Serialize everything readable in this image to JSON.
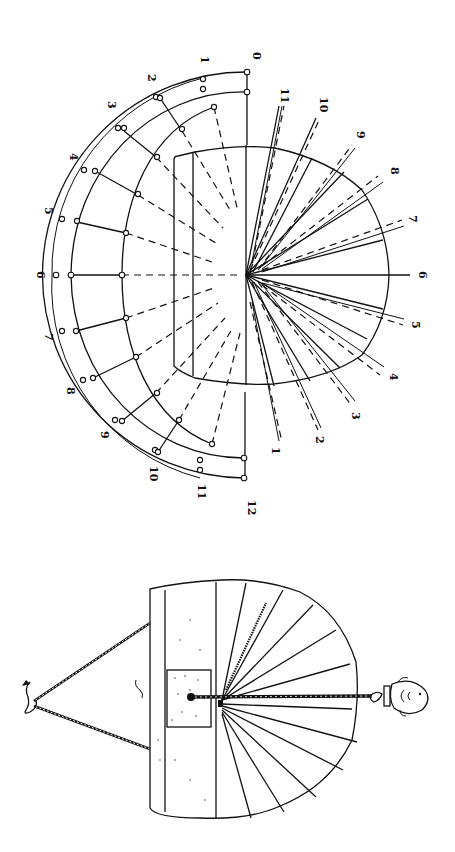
{
  "figure": {
    "top_diagram": {
      "description": "Sundial hour-line construction (rotated 90°)",
      "arc_hour_labels": [
        "0",
        "1",
        "2",
        "3",
        "4",
        "5",
        "6",
        "7",
        "8",
        "9",
        "10",
        "11",
        "12"
      ],
      "ray_hour_labels": [
        "11",
        "10",
        "9",
        "8",
        "7",
        "6",
        "5",
        "4",
        "3",
        "2",
        "1"
      ]
    },
    "bottom_diagram": {
      "description": "Portable hanging sundial with cord, hook and fish-shaped gnomon ornament"
    },
    "colors": {
      "ink": "#111111",
      "paper": "#ffffff"
    }
  }
}
